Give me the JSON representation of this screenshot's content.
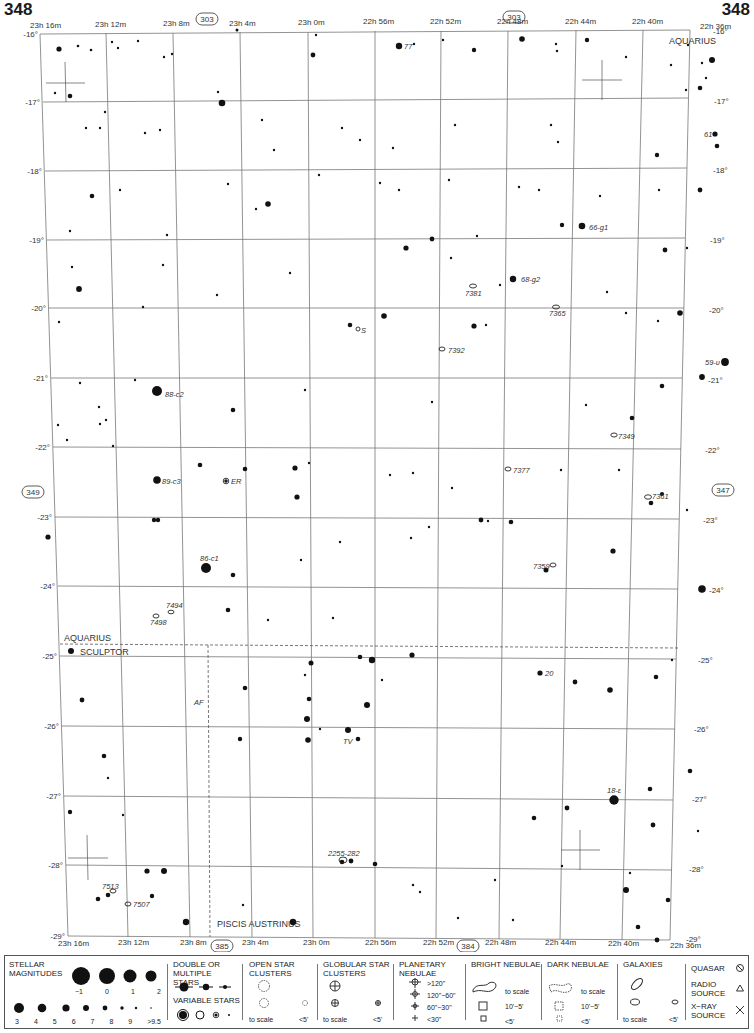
{
  "page": {
    "number_left": "348",
    "number_right": "348"
  },
  "grid": {
    "ra_labels_top": [
      "23h 16m",
      "23h 12m",
      "23h 8m",
      "23h 4m",
      "23h 0m",
      "22h 56m",
      "22h 52m",
      "22h 48m",
      "22h 44m",
      "22h 40m",
      "22h 36m"
    ],
    "ra_labels_bottom": [
      "23h 16m",
      "23h 12m",
      "23h 8m",
      "23h 4m",
      "23h 0m",
      "22h 56m",
      "22h 52m",
      "22h 48m",
      "22h 44m",
      "22h 40m",
      "22h 36m"
    ],
    "dec_labels": [
      "-16°",
      "-17°",
      "-18°",
      "-19°",
      "-20°",
      "-21°",
      "-22°",
      "-23°",
      "-24°",
      "-25°",
      "-26°",
      "-27°",
      "-28°",
      "-29°"
    ]
  },
  "adjacent_charts": {
    "top_left": "303",
    "top_right": "303",
    "left": "349",
    "right": "347",
    "bottom_left": "385",
    "bottom_right": "384"
  },
  "constellations": {
    "aquarius_top": "AQUARIUS",
    "aquarius_boundary": "AQUARIUS",
    "sculptor": "SCULPTOR",
    "piscis_austrinus": "PISCIS AUSTRINUS"
  },
  "objects": [
    {
      "label": "77",
      "x": 404,
      "y": 46
    },
    {
      "label": "61",
      "x": 712,
      "y": 134
    },
    {
      "label": "66-g1",
      "x": 589,
      "y": 227
    },
    {
      "label": "68-g2",
      "x": 521,
      "y": 279
    },
    {
      "label": "7381",
      "x": 473,
      "y": 293
    },
    {
      "label": "7365",
      "x": 556,
      "y": 313
    },
    {
      "label": "S",
      "x": 361,
      "y": 330
    },
    {
      "label": "7392",
      "x": 448,
      "y": 350
    },
    {
      "label": "59-υ",
      "x": 707,
      "y": 362
    },
    {
      "label": "88-c2",
      "x": 165,
      "y": 394
    },
    {
      "label": "7349",
      "x": 621,
      "y": 437
    },
    {
      "label": "7377",
      "x": 516,
      "y": 470
    },
    {
      "label": "89-c3",
      "x": 161,
      "y": 481
    },
    {
      "label": "ER",
      "x": 229,
      "y": 481
    },
    {
      "label": "7361",
      "x": 655,
      "y": 496
    },
    {
      "label": "86-c1",
      "x": 201,
      "y": 560
    },
    {
      "label": "7359",
      "x": 535,
      "y": 567
    },
    {
      "label": "7494",
      "x": 168,
      "y": 607
    },
    {
      "label": "7498",
      "x": 154,
      "y": 623
    },
    {
      "label": "20",
      "x": 545,
      "y": 673
    },
    {
      "label": "AF",
      "x": 196,
      "y": 704
    },
    {
      "label": "TV",
      "x": 346,
      "y": 742
    },
    {
      "label": "18-ε",
      "x": 609,
      "y": 792
    },
    {
      "label": "2255-282",
      "x": 328,
      "y": 854
    },
    {
      "label": "7513",
      "x": 102,
      "y": 888
    },
    {
      "label": "7507",
      "x": 133,
      "y": 905
    }
  ],
  "legend": {
    "stellar_magnitudes": {
      "title": "STELLAR MAGNITUDES",
      "row1": [
        "−1",
        "0",
        "1",
        "2"
      ],
      "row2": [
        "3",
        "4",
        "5",
        "6",
        "7",
        "8",
        "9",
        ">9.5"
      ]
    },
    "double_stars": {
      "title": "DOUBLE OR MULTIPLE STARS"
    },
    "variable_stars": {
      "title": "VARIABLE STARS"
    },
    "open_clusters": {
      "title": "OPEN STAR CLUSTERS",
      "to_scale": "to scale",
      "small": "<5'"
    },
    "globular_clusters": {
      "title": "GLOBULAR STAR CLUSTERS",
      "to_scale": "to scale",
      "small": "<5'"
    },
    "planetary_nebulae": {
      "title": "PLANETARY NEBULAE",
      "sizes": [
        ">120\"",
        "120\"−60\"",
        "60\"−30\"",
        "<30\""
      ]
    },
    "bright_nebulae": {
      "title": "BRIGHT NEBULAE",
      "sizes": [
        "to scale",
        "10'−5'",
        "<5'"
      ]
    },
    "dark_nebulae": {
      "title": "DARK NEBULAE",
      "sizes": [
        "to scale",
        "10'−5'",
        "<5'"
      ]
    },
    "galaxies": {
      "title": "GALAXIES",
      "to_scale": "to scale",
      "small": "<5'"
    },
    "quasar": {
      "title": "QUASAR"
    },
    "radio_source": {
      "title": "RADIO SOURCE"
    },
    "xray_source": {
      "title": "X−RAY SOURCE"
    }
  }
}
